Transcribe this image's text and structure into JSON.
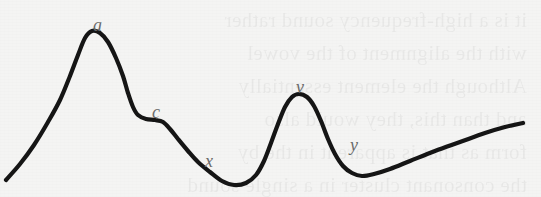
{
  "figure": {
    "kind": "hand-drawn-curve-diagram",
    "width": 541,
    "height": 197,
    "background_color": "#f4f4f3",
    "curve_color": "#151515",
    "curve_stroke_width": 4.2,
    "label_color": "#6a6a6a"
  },
  "ghost_text": "it is a high-frequency sound rather\nwith the alignment of the vowel\nAlthough the element essentially\nand than this, they would also\nform as that is apparent in the by\nthe consonant cluster in a single sound",
  "labels": [
    {
      "id": "a",
      "text": "a",
      "x": 93,
      "y": 16,
      "describes": "first-peak-apex"
    },
    {
      "id": "c",
      "text": "c",
      "x": 152,
      "y": 103,
      "describes": "shoulder-inflection"
    },
    {
      "id": "x",
      "text": "x",
      "x": 205,
      "y": 152,
      "describes": "descending-limb"
    },
    {
      "id": "v",
      "text": "v",
      "x": 296,
      "y": 78,
      "describes": "second-peak-apex"
    },
    {
      "id": "y",
      "text": "y",
      "x": 350,
      "y": 136,
      "describes": "descending-limb-second-peak"
    }
  ],
  "chart_data": {
    "type": "line",
    "title": "",
    "xlabel": "",
    "ylabel": "",
    "grid": false,
    "legend": null,
    "xlim": [
      0,
      541
    ],
    "ylim": [
      197,
      0
    ],
    "annotations": [
      {
        "label": "a",
        "x": 88,
        "y": 31,
        "note": "first peak (maximum)"
      },
      {
        "label": "c",
        "x": 150,
        "y": 120,
        "note": "shoulder / plateau inflection on descent"
      },
      {
        "label": "x",
        "x": 200,
        "y": 160,
        "note": "steep descending limb"
      },
      {
        "label": "v",
        "x": 298,
        "y": 94,
        "note": "second peak (local maximum)"
      },
      {
        "label": "y",
        "x": 345,
        "y": 150,
        "note": "descending limb of second peak"
      }
    ],
    "series": [
      {
        "name": "contour",
        "points": [
          [
            6,
            180
          ],
          [
            20,
            164
          ],
          [
            34,
            145
          ],
          [
            48,
            122
          ],
          [
            60,
            100
          ],
          [
            70,
            76
          ],
          [
            78,
            55
          ],
          [
            85,
            38
          ],
          [
            92,
            31
          ],
          [
            100,
            33
          ],
          [
            108,
            42
          ],
          [
            116,
            58
          ],
          [
            123,
            76
          ],
          [
            128,
            93
          ],
          [
            133,
            107
          ],
          [
            138,
            115
          ],
          [
            146,
            119
          ],
          [
            155,
            120
          ],
          [
            163,
            122
          ],
          [
            170,
            129
          ],
          [
            178,
            139
          ],
          [
            188,
            151
          ],
          [
            198,
            162
          ],
          [
            210,
            172
          ],
          [
            222,
            181
          ],
          [
            234,
            185
          ],
          [
            246,
            183
          ],
          [
            256,
            175
          ],
          [
            264,
            161
          ],
          [
            271,
            143
          ],
          [
            278,
            124
          ],
          [
            285,
            107
          ],
          [
            292,
            97
          ],
          [
            299,
            94
          ],
          [
            307,
            97
          ],
          [
            314,
            106
          ],
          [
            321,
            121
          ],
          [
            328,
            139
          ],
          [
            335,
            154
          ],
          [
            343,
            166
          ],
          [
            352,
            173
          ],
          [
            362,
            176
          ],
          [
            374,
            174
          ],
          [
            390,
            169
          ],
          [
            410,
            161
          ],
          [
            435,
            151
          ],
          [
            460,
            142
          ],
          [
            485,
            133
          ],
          [
            505,
            127
          ],
          [
            523,
            123
          ]
        ]
      }
    ]
  }
}
